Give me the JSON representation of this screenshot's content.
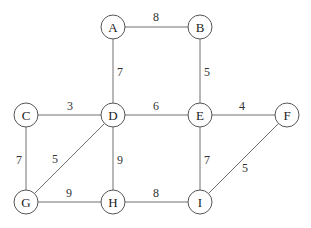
{
  "graph": {
    "type": "undirected-weighted",
    "nodes": [
      {
        "id": "A",
        "label": "A",
        "x": 113,
        "y": 27
      },
      {
        "id": "B",
        "label": "B",
        "x": 200,
        "y": 27
      },
      {
        "id": "C",
        "label": "C",
        "x": 26,
        "y": 115
      },
      {
        "id": "D",
        "label": "D",
        "x": 113,
        "y": 115
      },
      {
        "id": "E",
        "label": "E",
        "x": 200,
        "y": 115
      },
      {
        "id": "F",
        "label": "F",
        "x": 287,
        "y": 115
      },
      {
        "id": "G",
        "label": "G",
        "x": 26,
        "y": 202
      },
      {
        "id": "H",
        "label": "H",
        "x": 113,
        "y": 202
      },
      {
        "id": "I",
        "label": "I",
        "x": 200,
        "y": 202
      }
    ],
    "edges": [
      {
        "from": "A",
        "to": "B",
        "weight": "8",
        "lx": 156,
        "ly": 21
      },
      {
        "from": "A",
        "to": "D",
        "weight": "7",
        "lx": 120,
        "ly": 76
      },
      {
        "from": "B",
        "to": "E",
        "weight": "5",
        "lx": 207,
        "ly": 76
      },
      {
        "from": "C",
        "to": "D",
        "weight": "3",
        "lx": 70,
        "ly": 110
      },
      {
        "from": "D",
        "to": "E",
        "weight": "6",
        "lx": 156,
        "ly": 110
      },
      {
        "from": "E",
        "to": "F",
        "weight": "4",
        "lx": 242,
        "ly": 110
      },
      {
        "from": "C",
        "to": "G",
        "weight": "7",
        "lx": 19,
        "ly": 164
      },
      {
        "from": "G",
        "to": "D",
        "weight": "5",
        "lx": 55,
        "ly": 163
      },
      {
        "from": "D",
        "to": "H",
        "weight": "9",
        "lx": 120,
        "ly": 164
      },
      {
        "from": "E",
        "to": "I",
        "weight": "7",
        "lx": 207,
        "ly": 164
      },
      {
        "from": "F",
        "to": "I",
        "weight": "5",
        "lx": 245,
        "ly": 172
      },
      {
        "from": "G",
        "to": "H",
        "weight": "9",
        "lx": 69,
        "ly": 197
      },
      {
        "from": "H",
        "to": "I",
        "weight": "8",
        "lx": 156,
        "ly": 197
      }
    ]
  },
  "style": {
    "node_radius": 12,
    "edge_color": "#707070",
    "node_stroke": "#555555"
  }
}
